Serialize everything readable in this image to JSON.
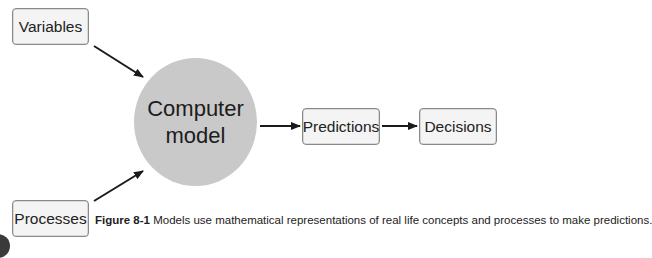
{
  "diagram": {
    "inputs": [
      {
        "id": "variables",
        "label": "Variables"
      },
      {
        "id": "processes",
        "label": "Processes"
      }
    ],
    "model": {
      "line1": "Computer",
      "line2": "model"
    },
    "outputs": [
      {
        "id": "predictions",
        "label": "Predictions"
      },
      {
        "id": "decisions",
        "label": "Decisions"
      }
    ],
    "edges": [
      {
        "from": "Variables",
        "to": "Computer model"
      },
      {
        "from": "Processes",
        "to": "Computer model"
      },
      {
        "from": "Computer model",
        "to": "Predictions"
      },
      {
        "from": "Predictions",
        "to": "Decisions"
      }
    ],
    "colors": {
      "model_fill": "#c9c9c9",
      "box_fill": "#f4f4f4",
      "box_border": "#8a8a8a",
      "arrow": "#1a1a1a"
    }
  },
  "caption": {
    "label": "Figure 8-1",
    "text": " Models use mathematical representations of real life concepts and processes to make predictions."
  }
}
